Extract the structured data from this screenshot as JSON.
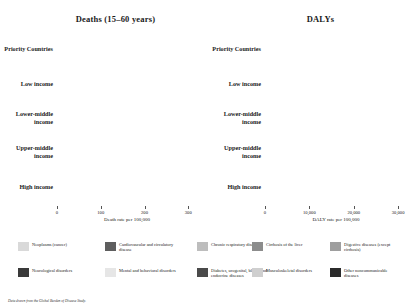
{
  "chart_data": {
    "type": "bar",
    "orientation": "horizontal",
    "stacked": true,
    "panels": [
      {
        "title": "Deaths (15–60 years)",
        "xlabel": "Death rate per 100,000",
        "xlim": [
          0,
          320
        ],
        "xticks": [
          0,
          100,
          200,
          300
        ],
        "xticklabels": [
          "0",
          "100",
          "200",
          "300"
        ],
        "grid": false,
        "categories": [
          "Priority Countries",
          "Low income",
          "Lower-middle income",
          "Upper-middle income",
          "High income"
        ],
        "series": [
          {
            "name": "Neoplasms (cancer)",
            "values": [
              40,
              35,
              42,
              46,
              54
            ]
          },
          {
            "name": "Cardiovascular and circulatory disease",
            "values": [
              95,
              88,
              98,
              62,
              32
            ]
          },
          {
            "name": "Chronic respiratory disease",
            "values": [
              16,
              18,
              20,
              10,
              6
            ]
          },
          {
            "name": "Cirrhosis of the liver",
            "values": [
              13,
              12,
              14,
              9,
              7
            ]
          },
          {
            "name": "Digestive diseases (except cirrhosis)",
            "values": [
              11,
              11,
              11,
              6,
              4
            ]
          },
          {
            "name": "Neurological disorders",
            "values": [
              4,
              4,
              4,
              3,
              4
            ]
          },
          {
            "name": "Mental and behavioral disorders",
            "values": [
              3,
              3,
              3,
              2,
              3
            ]
          },
          {
            "name": "Diabetes, urogenital, blood, and endocrine diseases",
            "values": [
              32,
              33,
              30,
              17,
              10
            ]
          },
          {
            "name": "Musculoskeletal disorders",
            "values": [
              2,
              2,
              2,
              1,
              1
            ]
          },
          {
            "name": "Other noncommunicable diseases",
            "values": [
              10,
              10,
              10,
              6,
              5
            ]
          }
        ]
      },
      {
        "title": "DALYs",
        "xlabel": "DALY rate per 100,000",
        "xlim": [
          0,
          32000
        ],
        "xticks": [
          0,
          10000,
          20000,
          30000
        ],
        "xticklabels": [
          "0",
          "10,000",
          "20,000",
          "30,000"
        ],
        "grid": false,
        "categories": [
          "Priority Countries",
          "Low income",
          "Lower-middle income",
          "Upper-middle income",
          "High income"
        ],
        "series": [
          {
            "name": "Neoplasms (cancer)",
            "values": [
              2400,
              2100,
              2500,
              2600,
              2700
            ]
          },
          {
            "name": "Cardiovascular and circulatory disease",
            "values": [
              5400,
              5000,
              5600,
              3500,
              1900
            ]
          },
          {
            "name": "Chronic respiratory disease",
            "values": [
              2000,
              2100,
              2200,
              1200,
              900
            ]
          },
          {
            "name": "Cirrhosis of the liver",
            "values": [
              700,
              650,
              750,
              500,
              400
            ]
          },
          {
            "name": "Digestive diseases (except cirrhosis)",
            "values": [
              900,
              900,
              900,
              500,
              400
            ]
          },
          {
            "name": "Neurological disorders",
            "values": [
              1700,
              1500,
              1700,
              1400,
              1600
            ]
          },
          {
            "name": "Mental and behavioral disorders",
            "values": [
              4300,
              3900,
              4200,
              4100,
              4600
            ]
          },
          {
            "name": "Diabetes, urogenital, blood, and endocrine diseases",
            "values": [
              3000,
              3000,
              2900,
              2000,
              1500
            ]
          },
          {
            "name": "Musculoskeletal disorders",
            "values": [
              2100,
              1900,
              2100,
              2000,
              2400
            ]
          },
          {
            "name": "Other noncommunicable diseases",
            "values": [
              3100,
              3000,
              3000,
              2100,
              1900
            ]
          }
        ]
      }
    ],
    "legend": {
      "position": "bottom",
      "entries": [
        {
          "label": "Neoplasms (cancer)",
          "color": "#d9d9d9"
        },
        {
          "label": "Cardiovascular and circulatory disease",
          "color": "#5e5e5e"
        },
        {
          "label": "Chronic respiratory disease",
          "color": "#bdbdbd"
        },
        {
          "label": "Cirrhosis of the liver",
          "color": "#8c8c8c"
        },
        {
          "label": "Digestive diseases (except cirrhosis)",
          "color": "#9e9e9e"
        },
        {
          "label": "Neurological disorders",
          "color": "#3a3a3a"
        },
        {
          "label": "Mental and behavioral disorders",
          "color": "#e6e6e6"
        },
        {
          "label": "Diabetes, urogenital, blood, and endocrine diseases",
          "color": "#4a4a4a"
        },
        {
          "label": "Musculoskeletal disorders",
          "color": "#cfcfcf"
        },
        {
          "label": "Other noncommunicable diseases",
          "color": "#2b2b2b"
        }
      ]
    }
  },
  "footnote": "Data drawn from the Global Burden of Disease Study."
}
